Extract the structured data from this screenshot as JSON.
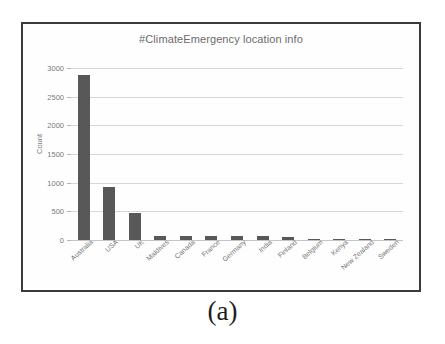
{
  "figure": {
    "caption": "(a)"
  },
  "chart_data": {
    "type": "bar",
    "title": "#ClimateEmergency location info",
    "xlabel": "",
    "ylabel": "Count",
    "ylim": [
      0,
      3000
    ],
    "grid": true,
    "legend": false,
    "bar_color": "#585858",
    "categories": [
      "Australia",
      "USA",
      "UK",
      "Maldives",
      "Canada",
      "France",
      "Germany",
      "India",
      "Finland",
      "Belgium",
      "Kenya",
      "New Zealand",
      "Sweden"
    ],
    "values": [
      2870,
      930,
      470,
      75,
      75,
      70,
      65,
      65,
      55,
      25,
      20,
      15,
      12
    ],
    "yticks": [
      0,
      500,
      1000,
      1500,
      2000,
      2500,
      3000
    ],
    "ytick_labels": [
      "0",
      "500",
      "1000",
      "1500",
      "2000",
      "2500",
      "3000"
    ]
  }
}
